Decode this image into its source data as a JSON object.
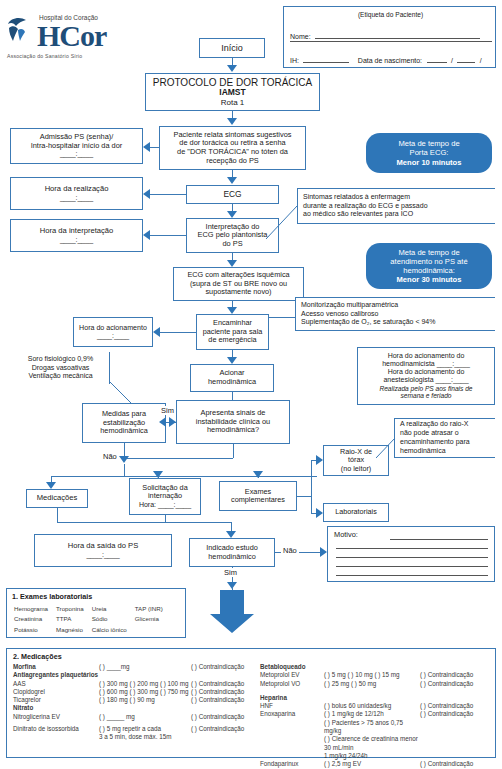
{
  "header": {
    "logo_top": "Hospital do Coração",
    "logo_main": "HCor",
    "logo_sub": "Associação do Sanatório Sírio"
  },
  "patient_label": {
    "title": "(Etiqueta do Paciente)",
    "name_label": "Nome:",
    "ih_label": "IH:",
    "birth_label": "Data de nascimento:",
    "date_sep1": "/",
    "date_sep2": "/"
  },
  "flow": {
    "start": "Início",
    "protocol_line1": "PROTOCOLO DE DOR TORÁCICA",
    "protocol_line2": "IAMST",
    "protocol_line3": "Rota 1",
    "symptoms_l1": "Paciente relata sintomas sugestivos",
    "symptoms_l2": "de dor torácica ou retira a senha",
    "symptoms_l3": "de \"DOR TORÁCICA\" no tóten da",
    "symptoms_l4": "recepção do PS",
    "admission_l1": "Admissão PS (senha)/",
    "admission_l2": "Intra-hospitalar início da dor",
    "admission_l3": "____:____",
    "ecg": "ECG",
    "hour_realization_l1": "Hora da realização",
    "hour_realization_l2": "____:____",
    "interpretation_l1": "Interpretação do",
    "interpretation_l2": "ECG pelo plantonista",
    "interpretation_l3": "do PS",
    "hour_interpretation_l1": "Hora da interpretação",
    "hour_interpretation_l2": "____:____",
    "ecg_alt_l1": "ECG com alterações isquêmica",
    "ecg_alt_l2": "(supra de ST ou BRE novo ou",
    "ecg_alt_l3": "supostamente novo)",
    "forward_l1": "Encaminhar",
    "forward_l2": "paciente para sala",
    "forward_l3": "de emergência",
    "hour_activation_l1": "Hora do acionamento",
    "hour_activation_l2": "____:____",
    "activate_hemo_l1": "Acionar",
    "activate_hemo_l2": "hemodinâmica",
    "stabilize_l1": "Medidas para",
    "stabilize_l2": "estabilização",
    "stabilize_l3": "hemodinâmica",
    "instability_l1": "Apresenta sinais de",
    "instability_l2": "instabilidade clínica ou",
    "instability_l3": "hemodinâmica?",
    "yes": "Sim",
    "no": "Não",
    "medications": "Medicações",
    "admission_request_l1": "Solicitação da",
    "admission_request_l2": "internação",
    "admission_request_l3": "Hora: ____:____",
    "complementary_l1": "Exames",
    "complementary_l2": "complementares",
    "xray_l1": "Raio-X de",
    "xray_l2": "tórax",
    "xray_l3": "(no leitor)",
    "labs": "Laboratoriais",
    "exit_hour_l1": "Hora da saída do PS",
    "exit_hour_l2": "____:____",
    "hemo_study_l1": "Indicado estudo",
    "hemo_study_l2": "hemodinâmico",
    "no_label": "Não",
    "yes_label": "Sim",
    "motive_label": "Motivo:"
  },
  "pills": {
    "door_ecg_l1": "Meta de tempo de",
    "door_ecg_l2": "Porta ECG:",
    "door_ecg_l3": "Menor 10 minutos",
    "hemo_l1": "Meta de tempo de",
    "hemo_l2": "atendimento no PS até",
    "hemo_l3": "hemodinâmica:",
    "hemo_l4": "Menor 30 minutos"
  },
  "notes": {
    "nursing_l1": "Sintomas relatados à enfermagem",
    "nursing_l2": "durante a realização do ECG e passado",
    "nursing_l3": "ao médico são relevantes para ICO",
    "monitoring_l1": "Monitorização multiparamétrica",
    "monitoring_l2": "Acesso venoso calibroso",
    "monitoring_l3": "Suplementação de O₂, se saturação < 94%",
    "fluids_l1": "Soro fisiológico 0,9%",
    "fluids_l2": "Drogas vasoativas",
    "fluids_l3": "Ventilação mecânica",
    "hemo_call_l1": "Hora do acionamento do",
    "hemo_call_l2": "hemodinamicista ____:____",
    "hemo_call_l3": "Hora do acionamento do",
    "hemo_call_l4": "anestesiologista ____:____",
    "hemo_call_l5": "Realizada pelo PS aos finais de",
    "hemo_call_l6": "semana e feriado",
    "xray_note_l1": "A realização do raio-X",
    "xray_note_l2": "não pode atrasar o",
    "xray_note_l3": "encaminhamento para",
    "xray_note_l4": "hemodinâmica"
  },
  "lab_panel": {
    "title": "1. Exames laboratoriais",
    "rows": [
      [
        "Hemograma",
        "Troponina",
        "Ureia",
        "TAP (INR)"
      ],
      [
        "Creatinina",
        "TTPA",
        "Sódio",
        "Glicemia"
      ],
      [
        "Potássio",
        "Magnésio",
        "Cálcio iônico",
        ""
      ]
    ]
  },
  "med_panel": {
    "title": "2. Medicações",
    "contra": "(   ) Contraindicação",
    "left": [
      {
        "name": "Morfina",
        "bold": true,
        "doses": "(   ) ____mg",
        "contra": true
      },
      {
        "name": "Antiagregantes plaquetários",
        "bold": true,
        "header": true
      },
      {
        "name": "AAS",
        "doses": "(   ) 300 mg  (   ) 200 mg  (   ) 100 mg",
        "contra": true
      },
      {
        "name": "Clopidogrel",
        "doses": "(   ) 600 mg  (   ) 300 mg  (   ) 750 mg",
        "contra": true
      },
      {
        "name": "Ticagrelor",
        "doses": "(   ) 180 mg  (   ) 90 mg",
        "contra": true
      },
      {
        "name": "Nitrato",
        "bold": true,
        "header": true
      },
      {
        "name": "Nitroglicerina EV",
        "doses": "(   ) _____ mg",
        "contra": true
      },
      {
        "name": "Dinitrato de isossorbida",
        "doses": "(   ) 5 mg repetir a cada",
        "doses2": "3 a 5 min, dose máx. 15m",
        "contra": true
      }
    ],
    "right": [
      {
        "name": "Betabloqueado",
        "bold": true,
        "header": true
      },
      {
        "name": "Metoprolol EV",
        "doses": "(   ) 5 mg   (   ) 10 mg  (   ) 15 mg",
        "contra": true
      },
      {
        "name": "Metoprolol VO",
        "doses": "(   ) 25 mg (   ) 50 mg",
        "contra": true
      },
      {
        "name": "Heparina",
        "bold": true,
        "header": true,
        "spacer": true
      },
      {
        "name": "HNF",
        "doses": "(   ) bolus 60 unidades/kg",
        "contra": true
      },
      {
        "name": "Enoxaparina",
        "doses": "(   ) 1 mg/kg de 12/12h",
        "contra": true,
        "extra": [
          "(   ) Pacientes > 75 anos 0,75 mg/kg",
          "(   ) Clearence de creatinina menor 30 mL/min",
          "1 mg/kg 24/24h"
        ]
      },
      {
        "name": "Fondaparinux",
        "doses": "(   ) 2,5 mg EV",
        "contra": true
      }
    ]
  },
  "colors": {
    "line": "#3c7ab5",
    "arrow": "#2e76b8",
    "pill": "#2e76b8",
    "logo": "#1f4e79"
  }
}
